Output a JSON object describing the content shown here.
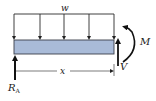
{
  "diagram": {
    "type": "free-body-diagram-beam-section",
    "labels": {
      "load": "w",
      "reaction_main": "R",
      "reaction_sub": "A",
      "distance": "x",
      "shear": "V",
      "moment": "M"
    },
    "colors": {
      "beam_fill": "#a9bbd8",
      "beam_stroke": "#3a3f4a",
      "line": "#2a2a2a",
      "arrow": "#111111"
    },
    "load_arrow_count": 5
  }
}
